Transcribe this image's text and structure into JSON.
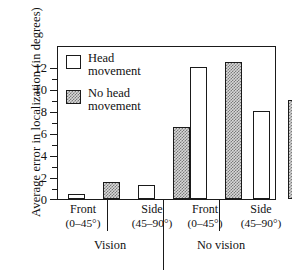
{
  "chart_data": {
    "type": "bar",
    "title": "",
    "ylabel": "Average error in localization (in degrees)",
    "xlabel": "",
    "ylim": [
      0,
      13.2
    ],
    "yticks": [
      0,
      2,
      4,
      6,
      8,
      10,
      12
    ],
    "ytick_labels": [
      "0",
      "2",
      "4",
      "6",
      "8",
      "10",
      "12"
    ],
    "minor_tick_step": 1,
    "grid": false,
    "legend_position": "upper left",
    "series": [
      {
        "name": "Head movement",
        "style": "open",
        "values": [
          0.4,
          1.2,
          12.0,
          8.0
        ]
      },
      {
        "name": "No head movement",
        "style": "hatched",
        "values": [
          1.5,
          6.5,
          12.5,
          9.0
        ]
      }
    ],
    "categories": [
      "Front (0–45°)",
      "Side (45–90°)",
      "Front (0–45°)",
      "Side (45–90°)"
    ],
    "groups": [
      {
        "label": "Vision",
        "categories": [
          "Front (0–45°)",
          "Side (45–90°)"
        ]
      },
      {
        "label": "No vision",
        "categories": [
          "Front (0–45°)",
          "Side (45–90°)"
        ]
      }
    ]
  },
  "legend": {
    "items": [
      {
        "line1": "Head",
        "line2": "movement",
        "swatch": "open-square-swatch"
      },
      {
        "line1": "No head",
        "line2": "movement",
        "swatch": "hatched-square-swatch"
      }
    ]
  },
  "axis": {
    "y_title": "Average error in localization (in degrees)",
    "y_labels": [
      "12",
      "10",
      "8",
      "6",
      "4",
      "2",
      "0"
    ]
  },
  "categories": [
    {
      "line1": "Front",
      "line2": "(0–45°)"
    },
    {
      "line1": "Side",
      "line2": "(45–90°)"
    },
    {
      "line1": "Front",
      "line2": "(0–45°)"
    },
    {
      "line1": "Side",
      "line2": "(45–90°)"
    }
  ],
  "groups": [
    {
      "label": "Vision"
    },
    {
      "label": "No vision"
    }
  ],
  "colors": {
    "ink": "#1a1a1a",
    "background": "#ffffff",
    "hatch_fill": "#d8d8d8",
    "hatch_line": "#6e6e6e"
  }
}
